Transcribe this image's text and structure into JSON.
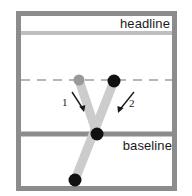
{
  "figure": {
    "kind": "letter-stroke-order-diagram",
    "letter": "y",
    "background_color": "#ffffff",
    "frame": {
      "color": "#8c8c8c",
      "x": 16,
      "y": 11,
      "width": 161,
      "height": 180,
      "thickness": 5
    }
  },
  "guides": [
    {
      "id": "headline",
      "label": "headline",
      "style": "solid",
      "color": "#bfbfbf",
      "y": 33,
      "thickness": 4
    },
    {
      "id": "xheight",
      "label": "",
      "style": "dashed",
      "color": "#b5b5b5",
      "y": 80,
      "thickness": 2,
      "dash": "9 7"
    },
    {
      "id": "baseline",
      "label": "baseline",
      "style": "solid",
      "color": "#8c8c8c",
      "y": 134,
      "thickness": 5
    }
  ],
  "labels": {
    "headline": "headline",
    "baseline": "baseline"
  },
  "strokes": [
    {
      "number": "1",
      "name": "left-diagonal-stroke",
      "color": "#cccccc",
      "width": 9,
      "from": {
        "x": 79,
        "y": 80
      },
      "to": {
        "x": 97,
        "y": 134
      },
      "start_dot": {
        "x": 79,
        "y": 80,
        "r": 5.5,
        "color": "#999999"
      },
      "end_dot": {
        "x": 97,
        "y": 134,
        "r": 6.5,
        "color": "#111111"
      }
    },
    {
      "number": "2",
      "name": "right-descender-stroke",
      "color": "#cccccc",
      "width": 9,
      "from": {
        "x": 114,
        "y": 81
      },
      "to": {
        "x": 75,
        "y": 180
      },
      "start_dot": {
        "x": 114,
        "y": 81,
        "r": 6.5,
        "color": "#111111"
      },
      "end_dot": {
        "x": 75,
        "y": 180,
        "r": 6.5,
        "color": "#111111"
      }
    }
  ],
  "arrows": [
    {
      "number": "1",
      "name": "stroke-1-direction-arrow",
      "color": "#1a1a1a",
      "from": {
        "x": 72,
        "y": 92
      },
      "to": {
        "x": 84,
        "y": 111
      }
    },
    {
      "number": "2",
      "name": "stroke-2-direction-arrow",
      "color": "#1a1a1a",
      "from": {
        "x": 134,
        "y": 92
      },
      "to": {
        "x": 118,
        "y": 112
      }
    }
  ]
}
